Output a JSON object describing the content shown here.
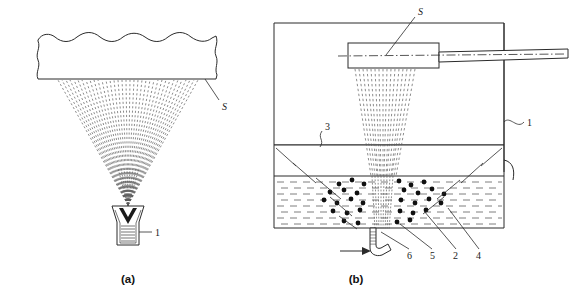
{
  "figure": {
    "background_color": "#ffffff",
    "ink_color": "#2b2b2b",
    "width": 569,
    "height": 299
  },
  "panels": [
    {
      "id": "a",
      "caption": "(a)",
      "description": "Conical spray from a single nozzle impinging on a substrate with wavy break edges",
      "callouts": [
        {
          "id": "a-s",
          "label": "S",
          "target": "substrate-surface"
        },
        {
          "id": "a-1",
          "label": "1",
          "target": "nozzle-body"
        }
      ]
    },
    {
      "id": "b",
      "caption": "(b)",
      "description": "Tank cross-section with horizontal spray bar, falling spray, liquid bath with particles and bottom inlet tube",
      "callouts": [
        {
          "id": "b-s",
          "label": "S",
          "target": "spray-bar"
        },
        {
          "id": "b-1",
          "label": "1",
          "target": "tank-wall"
        },
        {
          "id": "b-3",
          "label": "3",
          "target": "tank-divider-line"
        },
        {
          "id": "b-6",
          "label": "6",
          "target": "inlet-tube"
        },
        {
          "id": "b-5",
          "label": "5",
          "target": "spray-stream-in-liquid"
        },
        {
          "id": "b-2",
          "label": "2",
          "target": "particles"
        },
        {
          "id": "b-4",
          "label": "4",
          "target": "liquid-bath"
        }
      ]
    }
  ],
  "labels": {
    "panel_a_caption": "(a)",
    "panel_b_caption": "(b)",
    "a_substrate": "S",
    "a_nozzle": "1",
    "b_spraybar": "S",
    "b_wall": "1",
    "b_divider": "3",
    "b_inlet": "6",
    "b_stream": "5",
    "b_particles": "2",
    "b_liquid": "4"
  }
}
